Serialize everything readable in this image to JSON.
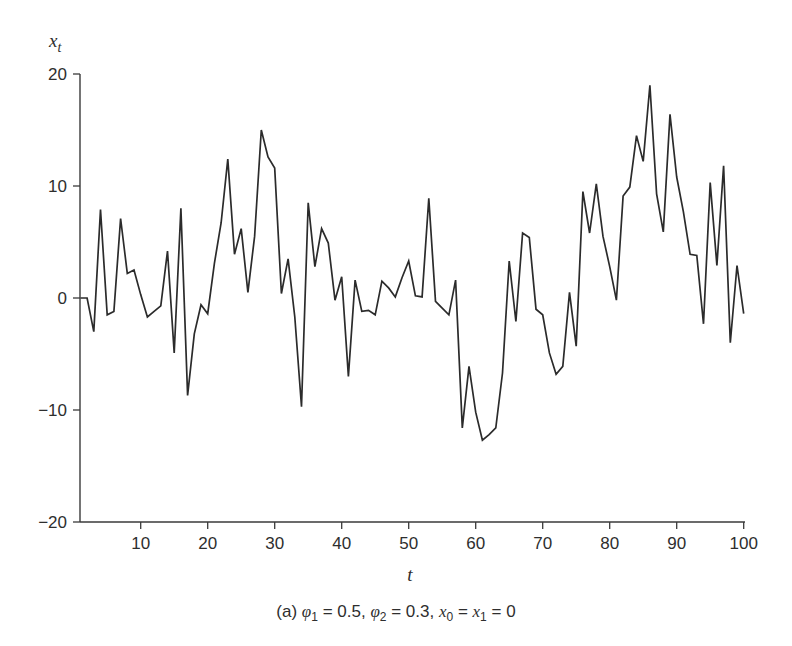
{
  "chart_data": {
    "type": "line",
    "title": "",
    "caption": {
      "prefix": "(a)",
      "text": "(a) φ₁ = 0.5, φ₂ = 0.3, x₀ = x₁ = 0",
      "phi1": "0.5",
      "phi2": "0.3",
      "x0_x1": "0"
    },
    "xlabel": "t",
    "ylabel": "x_t",
    "xlim": [
      1,
      100
    ],
    "ylim": [
      -20,
      20
    ],
    "xticks": [
      10,
      20,
      30,
      40,
      50,
      60,
      70,
      80,
      90,
      100
    ],
    "yticks": [
      -20,
      -10,
      0,
      10,
      20
    ],
    "grid": false,
    "legend": null,
    "series": [
      {
        "name": "x_t",
        "color": "#2b2b2b",
        "x": [
          1,
          2,
          3,
          4,
          5,
          6,
          7,
          8,
          9,
          10,
          11,
          12,
          13,
          14,
          15,
          16,
          17,
          18,
          19,
          20,
          21,
          22,
          23,
          24,
          25,
          26,
          27,
          28,
          29,
          30,
          31,
          32,
          33,
          34,
          35,
          36,
          37,
          38,
          39,
          40,
          41,
          42,
          43,
          44,
          45,
          46,
          47,
          48,
          49,
          50,
          51,
          52,
          53,
          54,
          55,
          56,
          57,
          58,
          59,
          60,
          61,
          62,
          63,
          64,
          65,
          66,
          67,
          68,
          69,
          70,
          71,
          72,
          73,
          74,
          75,
          76,
          77,
          78,
          79,
          80,
          81,
          82,
          83,
          84,
          85,
          86,
          87,
          88,
          89,
          90,
          91,
          92,
          93,
          94,
          95,
          96,
          97,
          98,
          99,
          100
        ],
        "values": [
          0,
          0,
          -3.0,
          7.9,
          -1.5,
          -1.2,
          7.1,
          2.2,
          2.5,
          0.3,
          -1.7,
          -1.2,
          -0.7,
          4.2,
          -4.9,
          8.0,
          -8.7,
          -3.2,
          -0.6,
          -1.4,
          3.1,
          6.7,
          12.4,
          3.9,
          6.2,
          0.5,
          5.5,
          15.0,
          12.6,
          11.6,
          0.4,
          3.5,
          -1.7,
          -9.7,
          8.5,
          2.8,
          6.2,
          4.9,
          -0.2,
          1.9,
          -7.0,
          1.6,
          -1.2,
          -1.1,
          -1.5,
          1.5,
          0.9,
          0.1,
          1.8,
          3.3,
          0.2,
          0.1,
          8.9,
          -0.3,
          -0.9,
          -1.5,
          1.6,
          -11.6,
          -6.1,
          -10.2,
          -12.7,
          -12.2,
          -11.6,
          -6.7,
          3.3,
          -2.1,
          5.8,
          5.4,
          -1.0,
          -1.5,
          -4.9,
          -6.8,
          -6.1,
          0.5,
          -4.3,
          9.5,
          5.8,
          10.2,
          5.5,
          2.8,
          -0.2,
          9.1,
          9.9,
          14.5,
          12.2,
          19.0,
          9.3,
          5.9,
          16.4,
          10.8,
          7.7,
          3.9,
          3.8,
          -2.3,
          10.3,
          2.9,
          11.8,
          -4.0,
          2.9,
          -1.4
        ]
      }
    ]
  },
  "labels": {
    "y_axis": "x",
    "y_axis_sub": "t",
    "x_axis": "t",
    "caption_prefix": "(a) ",
    "phi": "φ",
    "phi1_sub": "1",
    "phi1_eq": " = 0.5, ",
    "phi2_sub": "2",
    "phi2_eq": " = 0.3, ",
    "x": "x",
    "x0_sub": "0",
    "mid_eq": " = ",
    "x1_sub": "1",
    "end_eq": " = 0"
  }
}
